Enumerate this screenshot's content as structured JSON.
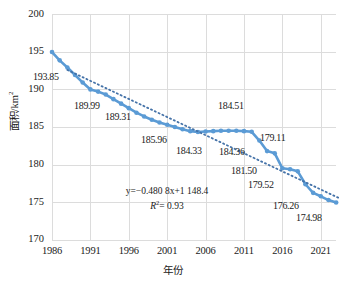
{
  "chart_data": {
    "type": "line",
    "title": "",
    "xlabel": "年份",
    "ylabel": "面积/km²",
    "ylim": [
      170,
      200
    ],
    "xlim": [
      1986,
      2023
    ],
    "yticks": [
      170,
      175,
      180,
      185,
      190,
      195,
      200
    ],
    "xticks": [
      1986,
      1991,
      1996,
      2001,
      2006,
      2011,
      2016,
      2021
    ],
    "grid": true,
    "legend": "none",
    "series": [
      {
        "name": "面积",
        "style": "solid-line-markers",
        "color": "#5B9BD5",
        "x": [
          1986,
          1987,
          1988,
          1989,
          1990,
          1991,
          1992,
          1993,
          1994,
          1995,
          1996,
          1997,
          1998,
          1999,
          2000,
          2001,
          2002,
          2003,
          2004,
          2005,
          2006,
          2007,
          2008,
          2009,
          2010,
          2011,
          2012,
          2013,
          2014,
          2015,
          2016,
          2017,
          2018,
          2019,
          2020,
          2021,
          2022,
          2023
        ],
        "values": [
          194.95,
          193.85,
          192.9,
          191.9,
          190.9,
          189.99,
          189.7,
          189.31,
          188.7,
          188.1,
          187.5,
          186.9,
          186.4,
          185.96,
          185.6,
          185.3,
          185.0,
          184.7,
          184.45,
          184.33,
          184.4,
          184.45,
          184.5,
          184.51,
          184.5,
          184.45,
          184.36,
          183.2,
          181.8,
          181.5,
          179.52,
          179.4,
          179.11,
          177.4,
          176.26,
          175.8,
          175.3,
          174.98
        ]
      },
      {
        "name": "线性趋势线",
        "style": "dotted-trendline",
        "color": "#4472A8",
        "equation": "y=−0.480 8x+1 148.4",
        "r_squared": "R²= 0.93",
        "slope": -0.4808,
        "intercept": 1148.4
      }
    ],
    "point_labels": [
      {
        "text": "193.85",
        "year": 1987,
        "value": 193.85
      },
      {
        "text": "189.99",
        "year": 1991,
        "value": 189.99
      },
      {
        "text": "189.31",
        "year": 1993,
        "value": 189.31
      },
      {
        "text": "185.96",
        "year": 1999,
        "value": 185.96
      },
      {
        "text": "184.33",
        "year": 2005,
        "value": 184.33
      },
      {
        "text": "184.51",
        "year": 2009,
        "value": 184.51
      },
      {
        "text": "184.36",
        "year": 2012,
        "value": 184.36
      },
      {
        "text": "181.50",
        "year": 2015,
        "value": 181.5
      },
      {
        "text": "179.11",
        "year": 2018,
        "value": 179.11
      },
      {
        "text": "179.52",
        "year": 2016,
        "value": 179.52
      },
      {
        "text": "176.26",
        "year": 2020,
        "value": 176.26
      },
      {
        "text": "174.98",
        "year": 2023,
        "value": 174.98
      }
    ],
    "annotations": {
      "equation_line1": "y=−0.480 8x+1 148.4",
      "equation_line2_prefix": "R",
      "equation_line2_sup": "2",
      "equation_line2_rest": "= 0.93"
    }
  },
  "colors": {
    "series": "#5B9BD5",
    "trendline": "#4A7EBB",
    "grid": "#dcdcdc",
    "text": "#1a1a1a",
    "background": "#ffffff"
  },
  "axes": {
    "y_labels": [
      "200",
      "195",
      "190",
      "185",
      "180",
      "175",
      "170"
    ],
    "x_labels": [
      "1986",
      "1991",
      "1996",
      "2001",
      "2006",
      "2011",
      "2016",
      "2021"
    ],
    "x_title": "年份",
    "y_title_text": "面积/km",
    "y_title_sup": "2"
  },
  "labels": {
    "l1": "193.85",
    "l2": "189.99",
    "l3": "189.31",
    "l4": "185.96",
    "l5": "184.33",
    "l6": "184.51",
    "l7": "184.36",
    "l8": "181.50",
    "l9": "179.11",
    "l10": "179.52",
    "l11": "176.26",
    "l12": "174.98"
  }
}
